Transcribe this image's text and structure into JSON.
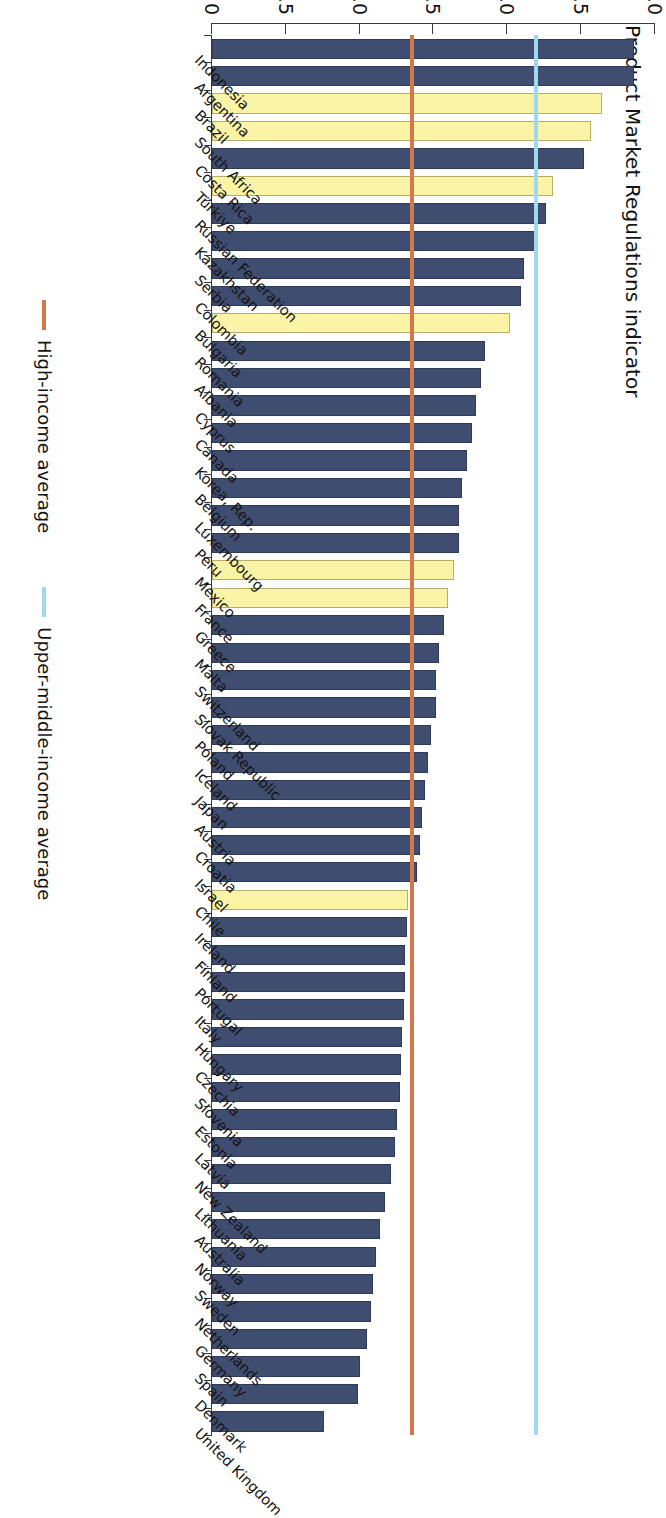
{
  "chart_data": {
    "type": "bar",
    "orientation": "horizontal",
    "title": "",
    "xlabel": "",
    "ylabel": "Product Market Regulations indicator",
    "value_axis_label": "Product Market Regulations indicator",
    "ylim": [
      0,
      3.0
    ],
    "axis_ticks": [
      "0",
      "0.5",
      "1.0",
      "1.5",
      "2.0",
      "2.5",
      "3.0"
    ],
    "axis_tick_values": [
      0,
      0.5,
      1.0,
      1.5,
      2.0,
      2.5,
      3.0
    ],
    "grid": false,
    "legend_position": "bottom",
    "series": [
      {
        "name": "Product Market Regulations indicator",
        "categories": [
          "Indonesia",
          "Argentina",
          "Brazil",
          "South Africa",
          "Costa Rica",
          "Türkiye",
          "Russian Federation",
          "Kazakhstan",
          "Serbia",
          "Colombia",
          "Bulgaria",
          "Romania",
          "Albania",
          "Cyprus",
          "Canada",
          "Korea, Rep.",
          "Belgium",
          "Luxembourg",
          "Peru",
          "Mexico",
          "France",
          "Greece",
          "Malta",
          "Switzerland",
          "Slovak Republic",
          "Poland",
          "Iceland",
          "Japan",
          "Austria",
          "Croatia",
          "Israel",
          "Chile",
          "Ireland",
          "Finland",
          "Portugal",
          "Italy",
          "Hungary",
          "Czechia",
          "Slovenia",
          "Estonia",
          "Latvia",
          "New Zealand",
          "Lithuania",
          "Australia",
          "Norway",
          "Sweden",
          "Netherlands",
          "Germany",
          "Spain",
          "Denmark",
          "United Kingdom"
        ],
        "values": [
          2.86,
          2.86,
          2.64,
          2.57,
          2.52,
          2.31,
          2.26,
          2.2,
          2.11,
          2.09,
          2.02,
          1.85,
          1.82,
          1.79,
          1.76,
          1.73,
          1.69,
          1.67,
          1.67,
          1.64,
          1.6,
          1.57,
          1.54,
          1.52,
          1.52,
          1.48,
          1.46,
          1.44,
          1.42,
          1.41,
          1.39,
          1.33,
          1.32,
          1.31,
          1.31,
          1.3,
          1.29,
          1.28,
          1.27,
          1.25,
          1.24,
          1.21,
          1.17,
          1.14,
          1.11,
          1.09,
          1.08,
          1.05,
          1.0,
          0.99,
          0.76
        ],
        "highlight_categories": [
          "Brazil",
          "South Africa",
          "Türkiye",
          "Bulgaria",
          "Mexico",
          "France",
          "Chile"
        ]
      }
    ],
    "reference_lines": [
      {
        "id": "upper-middle",
        "label": "Upper-middle-income average",
        "value": 2.21,
        "color": "#9fd8ef"
      },
      {
        "id": "high",
        "label": "High-income average",
        "value": 1.37,
        "color": "#d4784b"
      }
    ],
    "colors": {
      "bar_default": "#3f4d70",
      "bar_highlight": "#fbf4a6",
      "upper_middle_line": "#9fd8ef",
      "high_income_line": "#d4784b"
    }
  },
  "legend": {
    "items": [
      {
        "label": "High-income average",
        "color": "#d4784b"
      },
      {
        "label": "Upper-middle-income average",
        "color": "#9fd8ef"
      }
    ]
  }
}
